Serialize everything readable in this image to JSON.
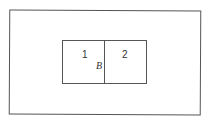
{
  "diagram": {
    "outer_region": {},
    "inner_box": {
      "cells": [
        {
          "label": "1"
        },
        {
          "label": "2"
        }
      ],
      "boundary_label": "B"
    }
  }
}
